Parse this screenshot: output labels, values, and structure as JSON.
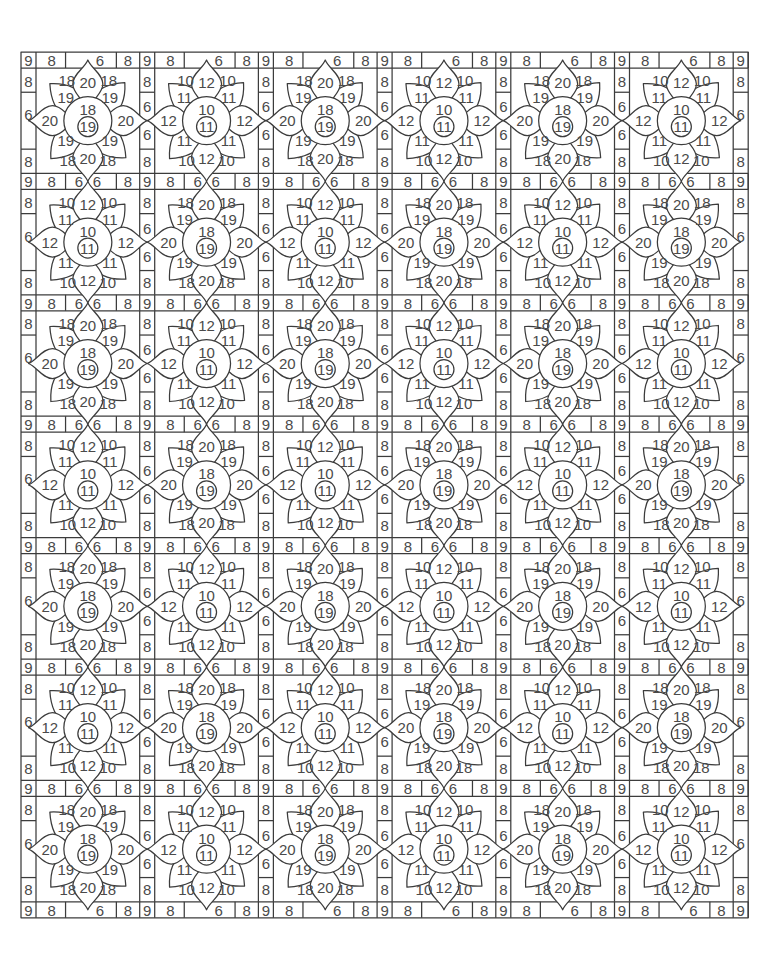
{
  "page": {
    "title": "Color by number - lotus tile pattern"
  },
  "grid": {
    "rows": 7,
    "cols": 6,
    "origin": [
      21,
      52
    ],
    "band_height": 16,
    "tile_height": 105.4,
    "sep_width": 15,
    "tile_width": 103.7,
    "line_color": "#3c3c3c",
    "text_color": "#4a4a4a"
  },
  "labels": {
    "band_corner": "9",
    "band_side": "8",
    "band_middle": "6",
    "column_end": "8",
    "column_middle": "6"
  },
  "flower_types": {
    "A": {
      "center_top": "18",
      "center_inner": "19",
      "lobes": "19",
      "corners": "18",
      "points": "20"
    },
    "B": {
      "center_top": "10",
      "center_inner": "11",
      "lobes": "11",
      "corners": "10",
      "points": "12"
    }
  },
  "layout": [
    [
      "A",
      "B",
      "A",
      "B",
      "A",
      "B"
    ],
    [
      "B",
      "A",
      "B",
      "A",
      "B",
      "A"
    ],
    [
      "A",
      "B",
      "A",
      "B",
      "A",
      "B"
    ],
    [
      "B",
      "A",
      "B",
      "A",
      "B",
      "A"
    ],
    [
      "A",
      "B",
      "A",
      "B",
      "A",
      "B"
    ],
    [
      "B",
      "A",
      "B",
      "A",
      "B",
      "A"
    ],
    [
      "A",
      "B",
      "A",
      "B",
      "A",
      "B"
    ]
  ]
}
